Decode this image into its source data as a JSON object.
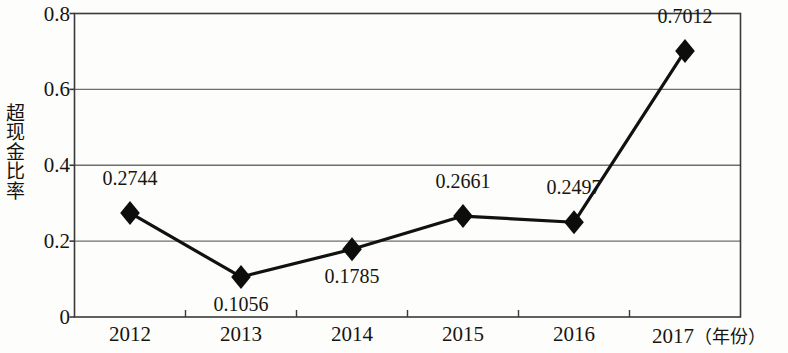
{
  "chart_data": {
    "type": "line",
    "title": "",
    "subtitle": "",
    "xlabel": "年份",
    "ylabel": "超现金比率",
    "categories": [
      "2012",
      "2013",
      "2014",
      "2015",
      "2016",
      "2017"
    ],
    "values": [
      0.2744,
      0.1056,
      0.1785,
      0.2661,
      0.2497,
      0.7012
    ],
    "point_labels": [
      "0.2744",
      "0.1056",
      "0.1785",
      "0.2661",
      "0.2497",
      "0.7012"
    ],
    "label_positions": [
      "above",
      "below",
      "below",
      "above",
      "above",
      "above"
    ],
    "ylim": [
      0,
      0.8
    ],
    "y_ticks": [
      0,
      0.2,
      0.4,
      0.6,
      0.8
    ],
    "y_tick_labels": [
      "0",
      "0.2",
      "0.4",
      "0.6",
      "0.8"
    ],
    "grid": true,
    "grid_axis": "y",
    "legend": false,
    "legend_position": "none",
    "marker": "diamond",
    "series": [
      {
        "name": "超现金比率",
        "values": [
          0.2744,
          0.1056,
          0.1785,
          0.2661,
          0.2497,
          0.7012
        ],
        "color": "#111111"
      }
    ],
    "colors": {
      "line": "#111111",
      "marker": "#0d0d0d",
      "grid": "#6e6e6e",
      "axis": "#3a3a3a",
      "text": "#16140f",
      "background": "#fdfdfb"
    }
  },
  "axis": {
    "x_last_suffix": "（年份）"
  }
}
